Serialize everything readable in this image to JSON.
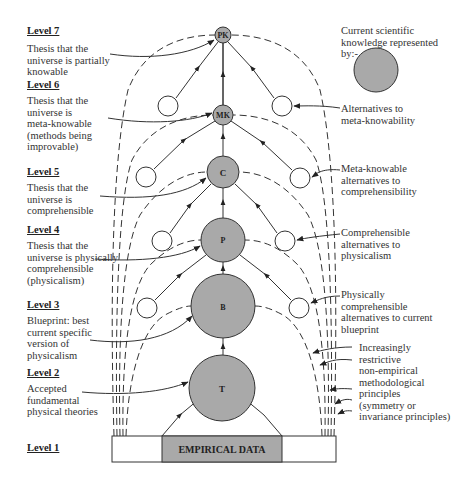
{
  "levels": [
    {
      "label": "Level 7",
      "description": [
        "Thesis that the",
        "universe is partially",
        "knowable"
      ]
    },
    {
      "label": "Level 6",
      "description": [
        "Thesis that the",
        "universe is",
        "meta-knowable",
        "(methods being",
        "improvable)"
      ]
    },
    {
      "label": "Level 5",
      "description": [
        "Thesis that the",
        "universe is",
        "comprehensible"
      ]
    },
    {
      "label": "Level 4",
      "description": [
        "Thesis that the",
        "universe is physically",
        "comprehensible",
        "(physicalism)"
      ]
    },
    {
      "label": "Level 3",
      "description": [
        "Blueprint: best",
        "current specific",
        "version of",
        "physicalism"
      ]
    },
    {
      "label": "Level 2",
      "description": [
        "Accepted",
        "fundamental",
        "physical theories"
      ]
    },
    {
      "label": "Level 1",
      "description": []
    }
  ],
  "nodes": [
    {
      "id": "PK",
      "label": "PK"
    },
    {
      "id": "MK",
      "label": "MK"
    },
    {
      "id": "C",
      "label": "C"
    },
    {
      "id": "P",
      "label": "P"
    },
    {
      "id": "B",
      "label": "B"
    },
    {
      "id": "T",
      "label": "T"
    }
  ],
  "base": {
    "label": "EMPIRICAL DATA"
  },
  "legend": {
    "text": [
      "Current scientific",
      "knowledge represented",
      "by:-"
    ],
    "fill_color": "#a9a9a9"
  },
  "right_annotations": [
    {
      "text": [
        "Alternatives to",
        "meta-knowability"
      ]
    },
    {
      "text": [
        "Meta-knowable",
        "alternatives to",
        "comprehensibility"
      ]
    },
    {
      "text": [
        "Comprehensible",
        "alternatives to",
        "physicalism"
      ]
    },
    {
      "text": [
        "Physically",
        "comprehensible",
        "alternatives to current",
        "blueprint"
      ]
    },
    {
      "text": [
        "Increasingly",
        "restrictive",
        "non-empirical",
        "methodological",
        "principles",
        "(symmetry or",
        "invariance principles)"
      ]
    }
  ],
  "colors": {
    "node_fill": "#a9a9a9",
    "line": "#333333",
    "base_fill": "#a9a9a9"
  }
}
